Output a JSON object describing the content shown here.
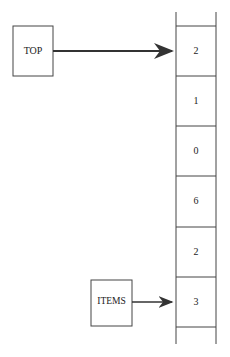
{
  "diagram": {
    "top_pointer": {
      "label": "TOP"
    },
    "items_pointer": {
      "label": "ITEMS"
    },
    "stack_cells": [
      "2",
      "1",
      "0",
      "6",
      "2",
      "3"
    ],
    "colors": {
      "line": "#444444",
      "text": "#222222",
      "background": "#ffffff"
    }
  }
}
